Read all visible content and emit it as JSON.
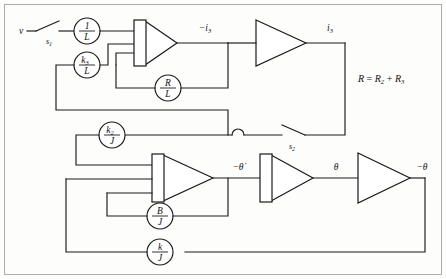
{
  "figure": {
    "background_color": "#fdfdfc",
    "line_color": "#1a1a1a",
    "width": 446,
    "height": 279
  },
  "signals": {
    "input_voltage": "v",
    "current_negative": "−i",
    "current_negative_sub": "3",
    "current_positive": "i",
    "current_positive_sub": "3",
    "theta_dot_negative": "−θ̇",
    "theta": "θ",
    "theta_negative": "−θ"
  },
  "switches": [
    {
      "id": "s1",
      "label": "s",
      "subscript": "1"
    },
    {
      "id": "s2",
      "label": "s",
      "subscript": "2"
    }
  ],
  "potentiometers": [
    {
      "id": "pot-1-over-L",
      "numerator": "1",
      "numerator_sub": "",
      "denominator": "L"
    },
    {
      "id": "pot-k3-over-L",
      "numerator": "k",
      "numerator_sub": "3",
      "denominator": "L"
    },
    {
      "id": "pot-R-over-L",
      "numerator": "R",
      "numerator_sub": "",
      "denominator": "L"
    },
    {
      "id": "pot-k2-over-J",
      "numerator": "k",
      "numerator_sub": "2",
      "denominator": "J"
    },
    {
      "id": "pot-B-over-J",
      "numerator": "B",
      "numerator_sub": "",
      "denominator": "J"
    },
    {
      "id": "pot-k-over-J",
      "numerator": "k",
      "numerator_sub": "",
      "denominator": "J"
    }
  ],
  "amplifiers": [
    {
      "id": "integrator-current",
      "type": "integrator",
      "inputs": 3
    },
    {
      "id": "inverter-current",
      "type": "inverter",
      "inputs": 1
    },
    {
      "id": "integrator-speed",
      "type": "integrator",
      "inputs": 3
    },
    {
      "id": "integrator-angle",
      "type": "integrator",
      "inputs": 1
    },
    {
      "id": "inverter-angle",
      "type": "inverter",
      "inputs": 1
    }
  ],
  "annotation": {
    "equation_lhs": "R",
    "equation_eq": " = ",
    "equation_r2": "R",
    "equation_r2_sub": "2",
    "equation_plus": " + ",
    "equation_r3": "R",
    "equation_r3_sub": "3"
  }
}
